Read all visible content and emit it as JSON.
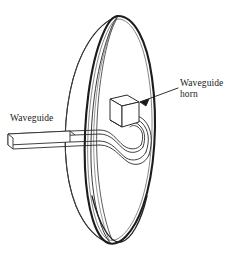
{
  "figure": {
    "background_color": "#ffffff",
    "line_color": "#2b2b2b",
    "rim_color": "#1c1c1c",
    "text_color": "#1a1a1a"
  },
  "labels": {
    "waveguide": "Waveguide",
    "waveguide_horn_line1": "Waveguide",
    "waveguide_horn_line2": "horn"
  },
  "parts": {
    "dish_name": "parabolic-dish",
    "rim_name": "dish-rim-ellipse",
    "waveguide_name": "waveguide-tube",
    "s_bend_name": "waveguide-s-bend",
    "u_loop_name": "waveguide-u-loop",
    "horn_name": "waveguide-horn-box",
    "leader_name": "leader-arrow"
  }
}
